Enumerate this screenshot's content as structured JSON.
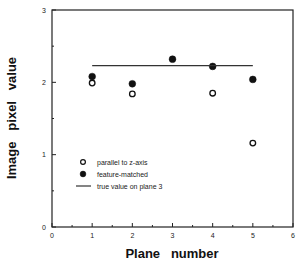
{
  "chart_data": {
    "type": "scatter",
    "title": "",
    "xlabel": "Plane   number",
    "ylabel": "Image   pixel   value",
    "xlim": [
      0,
      6
    ],
    "ylim": [
      0,
      3
    ],
    "x_major_ticks": [
      0,
      1,
      2,
      3,
      4,
      5,
      6
    ],
    "x_minor_ticks": [
      0.5,
      1.5,
      2.5,
      3.5,
      4.5,
      5.5
    ],
    "y_major_ticks": [
      0,
      1,
      2,
      3
    ],
    "y_minor_ticks": [
      0.5,
      1.5,
      2.5
    ],
    "grid": false,
    "legend_position": "lower-left inside plot",
    "series": [
      {
        "name": "parallel to z-axis",
        "marker": "open-circle",
        "x": [
          1,
          2,
          4,
          5
        ],
        "y": [
          1.99,
          1.84,
          1.85,
          1.16
        ]
      },
      {
        "name": "feature-matched",
        "marker": "filled-circle",
        "x": [
          1,
          2,
          3,
          4,
          5
        ],
        "y": [
          2.08,
          1.98,
          2.32,
          2.22,
          2.04
        ]
      },
      {
        "name": "true value on plane 3",
        "marker": "line",
        "x": [
          1,
          5
        ],
        "y": [
          2.23,
          2.23
        ]
      }
    ],
    "colors": {
      "axis": "#222222",
      "marker": "#111111",
      "background": "#ffffff"
    }
  }
}
